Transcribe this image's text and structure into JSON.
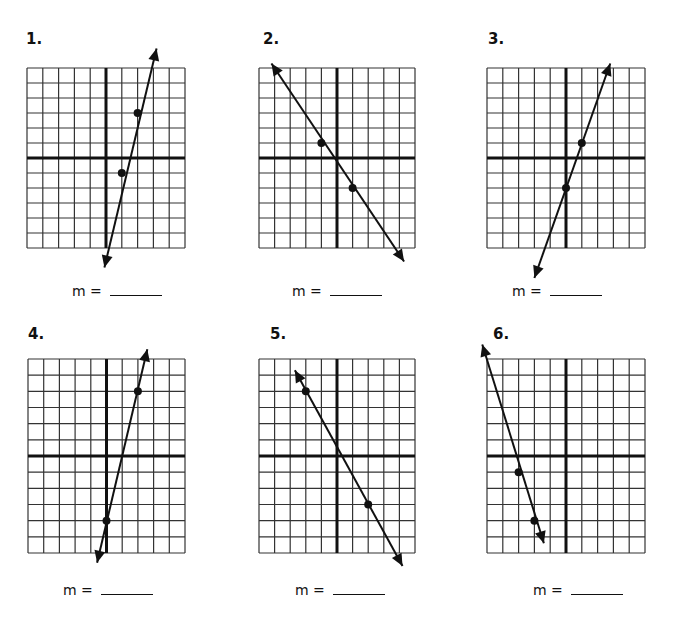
{
  "worksheet": {
    "answer_prompt": "m =",
    "grid": {
      "columns": 10,
      "rows": 12,
      "x_axis_row_from_top": 6,
      "y_axis_col_from_left": 5
    },
    "colors": {
      "ink": "#111111",
      "grid_line": "#333333",
      "background": "#ffffff"
    }
  },
  "chart_data": [
    {
      "type": "line",
      "title": "1.",
      "label": "1.",
      "points": [
        [
          1,
          -1
        ],
        [
          2,
          3
        ]
      ],
      "arrow_ends": [
        [
          -0.1,
          -7.3
        ],
        [
          3.2,
          7.3
        ]
      ],
      "answer": ""
    },
    {
      "type": "line",
      "title": "2.",
      "label": "2.",
      "points": [
        [
          -1,
          1
        ],
        [
          1,
          -2
        ]
      ],
      "arrow_ends": [
        [
          -4.2,
          6.3
        ],
        [
          4.3,
          -6.9
        ]
      ],
      "answer": ""
    },
    {
      "type": "line",
      "title": "3.",
      "label": "3.",
      "points": [
        [
          0,
          -2
        ],
        [
          1,
          1
        ]
      ],
      "arrow_ends": [
        [
          2.8,
          6.3
        ],
        [
          -2.0,
          -8.0
        ]
      ],
      "answer": ""
    },
    {
      "type": "line",
      "title": "4.",
      "label": "4.",
      "points": [
        [
          0,
          -4
        ],
        [
          2,
          4
        ]
      ],
      "arrow_ends": [
        [
          2.6,
          6.6
        ],
        [
          -0.6,
          -6.6
        ]
      ],
      "answer": ""
    },
    {
      "type": "line",
      "title": "5.",
      "label": "5.",
      "points": [
        [
          -2,
          4
        ],
        [
          2,
          -3
        ]
      ],
      "arrow_ends": [
        [
          -2.7,
          5.3
        ],
        [
          4.2,
          -6.8
        ]
      ],
      "answer": ""
    },
    {
      "type": "line",
      "title": "6.",
      "label": "6.",
      "points": [
        [
          -3,
          -1
        ],
        [
          -2,
          -4
        ]
      ],
      "arrow_ends": [
        [
          -5.3,
          6.9
        ],
        [
          -1.4,
          -5.4
        ]
      ],
      "answer": ""
    }
  ]
}
